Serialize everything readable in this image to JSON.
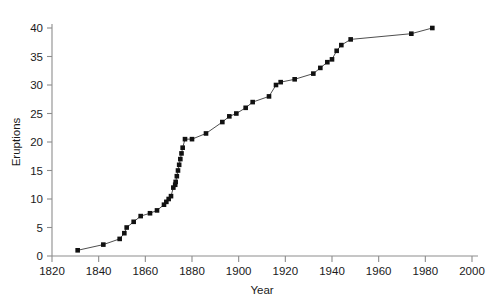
{
  "chart_data": {
    "type": "line",
    "title": "",
    "subtitle": "",
    "xlabel": "Year",
    "ylabel": "Eruptions",
    "xlim": [
      1820,
      2000
    ],
    "ylim": [
      0,
      40
    ],
    "xticks": [
      1820,
      1840,
      1860,
      1880,
      1900,
      1920,
      1940,
      1960,
      1980,
      2000
    ],
    "yticks": [
      0,
      5,
      10,
      15,
      20,
      25,
      30,
      35,
      40
    ],
    "xtick_labels": [
      "1820",
      "1840",
      "1860",
      "1880",
      "1900",
      "1920",
      "1940",
      "1960",
      "1980",
      "2000"
    ],
    "ytick_labels": [
      "0",
      "5",
      "10",
      "15",
      "20",
      "25",
      "30",
      "35",
      "40"
    ],
    "grid": false,
    "legend": false,
    "legend_position": "none",
    "marker": "square",
    "marker_color": "#111111",
    "line_color": "#3a3a3a",
    "axis_color": "#8d8d8d",
    "background_color": "#ffffff",
    "series": [
      {
        "name": "Cumulative eruptions",
        "x": [
          1831,
          1842,
          1849,
          1851,
          1852,
          1855,
          1858,
          1862,
          1865,
          1868,
          1869,
          1870,
          1871,
          1872,
          1872.8,
          1873,
          1873.5,
          1874,
          1874.5,
          1875,
          1875.5,
          1876,
          1877,
          1880,
          1886,
          1893,
          1896,
          1899,
          1903,
          1906,
          1913,
          1916,
          1918,
          1924,
          1932,
          1935,
          1938,
          1940,
          1942,
          1944,
          1948,
          1974,
          1983
        ],
        "y": [
          1,
          2,
          3,
          4,
          5,
          6,
          7,
          7.5,
          8,
          9,
          9.5,
          10,
          10.5,
          12,
          12.5,
          13,
          14,
          15,
          16,
          17,
          18,
          19,
          20.5,
          20.5,
          21.5,
          23.5,
          24.5,
          25,
          26,
          27,
          28,
          30,
          30.5,
          31,
          32,
          33,
          34,
          34.5,
          36,
          37,
          38,
          39,
          40
        ]
      }
    ]
  },
  "figure": {
    "plot_left_px": 52,
    "plot_right_px": 472,
    "plot_top_px": 28,
    "plot_bottom_px": 256
  }
}
